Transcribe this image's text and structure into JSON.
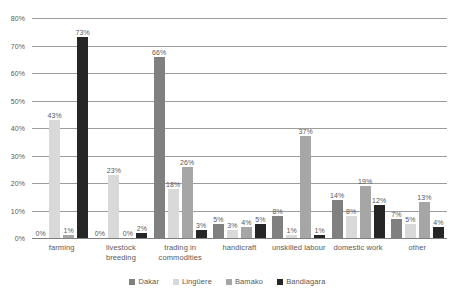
{
  "chart_data": {
    "type": "bar",
    "title": "",
    "subtitle": "",
    "xlabel": "",
    "ylabel": "",
    "ylim": [
      0,
      80
    ],
    "ytick_labels": [
      "80%",
      "70%",
      "60%",
      "50%",
      "40%",
      "30%",
      "20%",
      "10%",
      "0%"
    ],
    "ytick_values": [
      80,
      70,
      60,
      50,
      40,
      30,
      20,
      10,
      0
    ],
    "grid": true,
    "legend_position": "bottom",
    "value_suffix": "%",
    "categories": [
      "farming",
      "livestock breeding",
      "trading in commodities",
      "handicraft",
      "unskilled labour",
      "domestic work",
      "other"
    ],
    "category_lines": [
      [
        "farming"
      ],
      [
        "livestock",
        "breeding"
      ],
      [
        "trading in",
        "commodities"
      ],
      [
        "handicraft"
      ],
      [
        "unskilled labour"
      ],
      [
        "domestic work"
      ],
      [
        "other"
      ]
    ],
    "series": [
      {
        "name": "Dakar",
        "color": "#808080",
        "values": [
          0,
          0,
          66,
          5,
          8,
          14,
          7
        ],
        "labels": [
          "0%",
          "0%",
          "66%",
          "5%",
          "8%",
          "14%",
          "7%"
        ]
      },
      {
        "name": "Lingüere",
        "color": "#d9d9d9",
        "values": [
          43,
          23,
          18,
          3,
          1,
          8,
          5
        ],
        "labels": [
          "43%",
          "23%",
          "18%",
          "3%",
          "1%",
          "8%",
          "5%"
        ]
      },
      {
        "name": "Bamako",
        "color": "#a6a6a6",
        "values": [
          1,
          0,
          26,
          4,
          37,
          19,
          13
        ],
        "labels": [
          "1%",
          "0%",
          "26%",
          "4%",
          "37%",
          "19%",
          "13%"
        ]
      },
      {
        "name": "Bandiagara",
        "color": "#262626",
        "values": [
          73,
          2,
          3,
          5,
          1,
          12,
          4
        ],
        "labels": [
          "73%",
          "2%",
          "3%",
          "5%",
          "1%",
          "12%",
          "4%"
        ]
      }
    ]
  },
  "legend": {
    "items": [
      {
        "label": "Dakar",
        "color": "#808080"
      },
      {
        "label": "Lingüere",
        "color": "#d9d9d9"
      },
      {
        "label": "Bamako",
        "color": "#a6a6a6"
      },
      {
        "label": "Bandiagara",
        "color": "#262626"
      }
    ]
  },
  "colors": {
    "grid": "#9c9c9c",
    "axis": "#7f7f7f",
    "text": "#595959",
    "background": "#ffffff"
  }
}
